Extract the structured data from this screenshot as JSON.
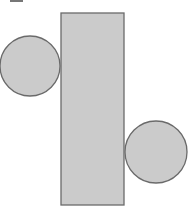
{
  "diagram": {
    "colors": {
      "fill": "#cbcbcb",
      "stroke": "#6a6a6a",
      "background": "#ffffff"
    },
    "shapes": [
      {
        "type": "rectangle",
        "name": "tall-rectangle",
        "x": 61,
        "y": 13,
        "width": 63,
        "height": 192
      },
      {
        "type": "circle",
        "name": "left-circle",
        "cx": 30,
        "cy": 66,
        "r": 30
      },
      {
        "type": "circle",
        "name": "right-circle",
        "cx": 156,
        "cy": 152,
        "r": 31
      }
    ]
  }
}
